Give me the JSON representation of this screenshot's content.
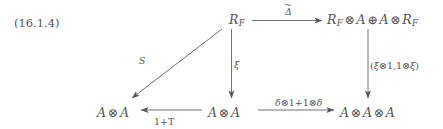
{
  "figure": {
    "equation_tag": "(16.1.4)",
    "type": "commutative-diagram",
    "background_color": "#ffffff",
    "ink_color": "#555555",
    "nodes": {
      "top_center": {
        "id": "R_F",
        "base": "R",
        "subscript": "F",
        "text": "R_F"
      },
      "top_right": {
        "id": "R_F_tensor_A_oplus_A_tensor_R_F",
        "text": "R_F ⊗ A ⊕ A ⊗ R_F",
        "parts": [
          "R",
          "F",
          "⊗",
          "A",
          "⊕",
          "A",
          "⊗",
          "R",
          "F"
        ]
      },
      "bottom_left": {
        "id": "A_tensor_A_left",
        "text": "A ⊗ A"
      },
      "bottom_center": {
        "id": "A_tensor_A_center",
        "text": "A ⊗ A"
      },
      "bottom_right": {
        "id": "A_tensor_A_tensor_A",
        "text": "A ⊗ A ⊗ A"
      }
    },
    "arrows": {
      "top_horizontal": {
        "from": "top_center",
        "to": "top_right",
        "direction": "right",
        "label": "Δ",
        "label_accent": "tilde",
        "label_text": "Δ̃"
      },
      "middle_vertical": {
        "from": "top_center",
        "to": "bottom_center",
        "direction": "down",
        "label": "ξ"
      },
      "diagonal": {
        "from": "top_center",
        "to": "bottom_left",
        "direction": "down-left",
        "label": "S"
      },
      "right_vertical": {
        "from": "top_right",
        "to": "bottom_right",
        "direction": "down",
        "label": "(ξ⊗1, 1⊗ξ)",
        "label_parts": [
          "(",
          "ξ",
          "⊗",
          "1",
          ",",
          "1",
          "⊗",
          "ξ",
          ")"
        ]
      },
      "bottom_left_horizontal": {
        "from": "bottom_center",
        "to": "bottom_left",
        "direction": "left",
        "label": "1+T"
      },
      "bottom_right_horizontal": {
        "from": "bottom_center",
        "to": "bottom_right",
        "direction": "right",
        "label": "δ⊗1+1⊗δ",
        "label_parts": [
          "δ",
          "⊗",
          "1",
          "+",
          "1",
          "⊗",
          "δ"
        ]
      }
    },
    "symbols": {
      "tensor": "⊗",
      "oplus": "⊕",
      "xi": "ξ",
      "delta_lower": "δ",
      "delta_upper": "Δ",
      "script_A": "A",
      "script_F": "F",
      "S": "S",
      "T": "T",
      "one": "1",
      "plus": "+"
    }
  }
}
